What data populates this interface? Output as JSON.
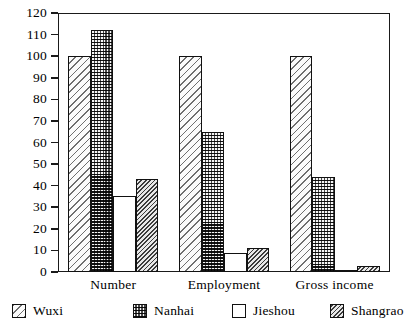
{
  "chart_data": {
    "type": "bar",
    "title": "",
    "subtitle": "",
    "xlabel": "",
    "ylabel": "",
    "categories": [
      "Number",
      "Employment",
      "Gross income"
    ],
    "series": [
      {
        "name": "Wuxi",
        "values": [
          100,
          100,
          100
        ],
        "pattern": "diagonal-hatch-light"
      },
      {
        "name": "Nanhai",
        "values": [
          112,
          65,
          44
        ],
        "pattern": "checkerboard-dark"
      },
      {
        "name": "Jieshou",
        "values": [
          35,
          9,
          1
        ],
        "pattern": "empty-white"
      },
      {
        "name": "Shangrao",
        "values": [
          43,
          11,
          3
        ],
        "pattern": "diagonal-hatch-dense"
      }
    ],
    "ylim": [
      0,
      120
    ],
    "ytick_step": 10,
    "yticks": [
      0,
      10,
      20,
      30,
      40,
      50,
      60,
      70,
      80,
      90,
      100,
      110,
      120
    ],
    "ytick_labels": [
      "0",
      "10",
      "20",
      "30",
      "40",
      "50",
      "60",
      "70",
      "80",
      "90",
      "100",
      "110",
      "120"
    ],
    "grid": false,
    "legend_position": "bottom",
    "legend": [
      "Wuxi",
      "Nanhai",
      "Jieshou",
      "Shangrao"
    ],
    "colors": {
      "axis": "#1a1a1a",
      "bar_outline": "#111111",
      "background": "#ffffff",
      "text": "#000000"
    }
  }
}
